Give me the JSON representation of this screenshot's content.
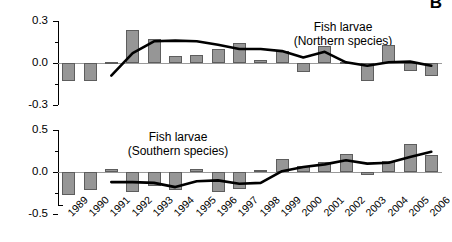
{
  "figure": {
    "panel_letter": "B",
    "y_axis_title": "Mean Standardized Species Richness"
  },
  "chart_data": [
    {
      "type": "bar",
      "id": "northern",
      "title": "Fish larvae",
      "subtitle": "(Northern species)",
      "annotation_line1": "Fish larvae",
      "annotation_line2": "(Northern species)",
      "xlabel": "",
      "ylabel": "Mean Standardized Species Richness",
      "ylim": [
        -0.3,
        0.3
      ],
      "yticks": [
        -0.3,
        0.0,
        0.3
      ],
      "ytick_labels": [
        "-0.3",
        "0.0",
        "0.3"
      ],
      "minor_yticks": [
        -0.15,
        0.15
      ],
      "grid": false,
      "legend": "none",
      "categories": [
        "1989",
        "1990",
        "1991",
        "1992",
        "1993",
        "1994",
        "1995",
        "1996",
        "1997",
        "1998",
        "1999",
        "2000",
        "2001",
        "2002",
        "2003",
        "2004",
        "2005",
        "2006"
      ],
      "series": [
        {
          "name": "Standardized species richness (bars)",
          "type": "bar",
          "values": [
            -0.13,
            -0.13,
            0.01,
            0.235,
            0.17,
            0.05,
            0.06,
            0.1,
            0.145,
            0.02,
            0.085,
            -0.065,
            0.125,
            0.005,
            -0.125,
            0.13,
            -0.055,
            -0.095
          ]
        },
        {
          "name": "Smoothed trend (line)",
          "type": "line",
          "values": [
            null,
            null,
            -0.09,
            0.07,
            0.155,
            0.16,
            0.155,
            0.13,
            0.1,
            0.1,
            0.085,
            0.04,
            0.08,
            0.005,
            -0.02,
            0.005,
            0.01,
            -0.02
          ]
        }
      ]
    },
    {
      "type": "bar",
      "id": "southern",
      "title": "Fish larvae",
      "subtitle": "(Southern species)",
      "annotation_line1": "Fish larvae",
      "annotation_line2": "(Southern species)",
      "xlabel": "",
      "ylabel": "Mean Standardized Species Richness",
      "ylim": [
        -0.5,
        0.5
      ],
      "yticks": [
        -0.5,
        0.0,
        0.5
      ],
      "ytick_labels": [
        "-0.5",
        "0.0",
        "0.5"
      ],
      "minor_yticks": [
        -0.25,
        0.25
      ],
      "grid": false,
      "legend": "none",
      "categories": [
        "1989",
        "1990",
        "1991",
        "1992",
        "1993",
        "1994",
        "1995",
        "1996",
        "1997",
        "1998",
        "1999",
        "2000",
        "2001",
        "2002",
        "2003",
        "2004",
        "2005",
        "2006"
      ],
      "series": [
        {
          "name": "Standardized species richness (bars)",
          "type": "bar",
          "values": [
            -0.27,
            -0.22,
            0.03,
            -0.24,
            -0.17,
            -0.21,
            0.03,
            -0.24,
            -0.2,
            0.02,
            0.16,
            0.07,
            0.12,
            0.22,
            -0.04,
            0.13,
            0.33,
            0.2
          ]
        },
        {
          "name": "Smoothed trend (line)",
          "type": "line",
          "values": [
            null,
            null,
            -0.12,
            -0.12,
            -0.13,
            -0.18,
            -0.11,
            -0.1,
            -0.14,
            -0.13,
            0.01,
            0.06,
            0.09,
            0.14,
            0.1,
            0.11,
            0.18,
            0.24
          ]
        }
      ]
    }
  ],
  "colors": {
    "bar_fill": "#969696",
    "bar_edge": "#5d5d5d",
    "line": "#000000",
    "axis": "#000000",
    "zero_line": "#9a9a9a"
  }
}
